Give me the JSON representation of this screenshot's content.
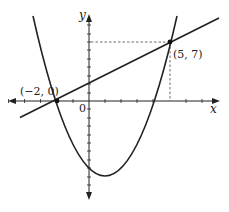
{
  "diagram": {
    "x_axis_label": "x",
    "y_axis_label": "y",
    "origin_label": "0",
    "points": [
      {
        "label": "(−2, 0)",
        "x": -2,
        "y": 0
      },
      {
        "label": "(5, 7)",
        "x": 5,
        "y": 7
      }
    ],
    "curves": [
      {
        "type": "parabola",
        "equation": "y = x^2 - 2x - 8",
        "roots": [
          -2,
          4
        ],
        "vertex": [
          1,
          -9
        ]
      },
      {
        "type": "line",
        "equation": "y = x + 2"
      }
    ],
    "x_ticks": [
      -5,
      -4,
      -3,
      -2,
      -1,
      1,
      2,
      3,
      4,
      5,
      6,
      7
    ],
    "y_ticks": [
      -11,
      -10,
      -9,
      -8,
      -7,
      -6,
      -5,
      -4,
      -3,
      -2,
      -1,
      1,
      2,
      3,
      4,
      5,
      6,
      7,
      8,
      9,
      10,
      11
    ],
    "colors": {
      "ink": "#222222",
      "dashed": "#444444"
    }
  }
}
